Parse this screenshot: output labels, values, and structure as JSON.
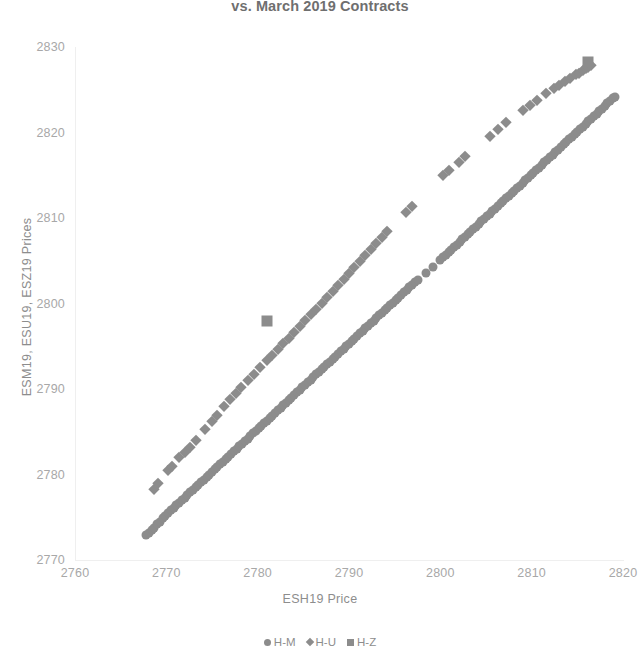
{
  "chart_data": {
    "type": "scatter",
    "title": "vs. March 2019 Contracts",
    "xlabel": "ESH19 Price",
    "ylabel": "ESM19, ESU19, ESZ19 Prices",
    "xlim": [
      2760,
      2820
    ],
    "ylim": [
      2770,
      2830
    ],
    "xticks": [
      2760,
      2770,
      2780,
      2790,
      2800,
      2810,
      2820
    ],
    "yticks": [
      2770,
      2780,
      2790,
      2800,
      2810,
      2820,
      2830
    ],
    "grid": false,
    "legend_position": "bottom",
    "marker_color": "#8c8c8c",
    "series": [
      {
        "name": "H-M",
        "marker": "circle",
        "points": [
          [
            2767.8,
            2772.9
          ],
          [
            2768.1,
            2773.2
          ],
          [
            2768.4,
            2773.5
          ],
          [
            2768.7,
            2773.8
          ],
          [
            2769.0,
            2774.2
          ],
          [
            2769.3,
            2774.5
          ],
          [
            2769.6,
            2774.9
          ],
          [
            2769.9,
            2775.2
          ],
          [
            2770.2,
            2775.5
          ],
          [
            2770.5,
            2775.8
          ],
          [
            2770.8,
            2776.1
          ],
          [
            2771.1,
            2776.4
          ],
          [
            2771.4,
            2776.7
          ],
          [
            2771.7,
            2777.0
          ],
          [
            2772.0,
            2777.3
          ],
          [
            2772.3,
            2777.6
          ],
          [
            2772.6,
            2777.9
          ],
          [
            2772.9,
            2778.2
          ],
          [
            2773.2,
            2778.5
          ],
          [
            2773.5,
            2778.8
          ],
          [
            2773.8,
            2779.1
          ],
          [
            2774.1,
            2779.4
          ],
          [
            2774.4,
            2779.7
          ],
          [
            2774.7,
            2780.0
          ],
          [
            2775.0,
            2780.3
          ],
          [
            2775.3,
            2780.6
          ],
          [
            2775.6,
            2780.9
          ],
          [
            2775.9,
            2781.2
          ],
          [
            2776.2,
            2781.5
          ],
          [
            2776.5,
            2781.8
          ],
          [
            2776.8,
            2782.1
          ],
          [
            2777.1,
            2782.4
          ],
          [
            2777.4,
            2782.7
          ],
          [
            2777.7,
            2783.0
          ],
          [
            2778.0,
            2783.3
          ],
          [
            2778.3,
            2783.6
          ],
          [
            2778.6,
            2783.9
          ],
          [
            2778.9,
            2784.2
          ],
          [
            2779.2,
            2784.5
          ],
          [
            2779.5,
            2784.8
          ],
          [
            2779.8,
            2785.1
          ],
          [
            2780.1,
            2785.4
          ],
          [
            2780.4,
            2785.7
          ],
          [
            2780.7,
            2786.0
          ],
          [
            2781.0,
            2786.3
          ],
          [
            2781.3,
            2786.6
          ],
          [
            2781.6,
            2786.9
          ],
          [
            2781.9,
            2787.2
          ],
          [
            2782.2,
            2787.5
          ],
          [
            2782.5,
            2787.8
          ],
          [
            2782.8,
            2788.1
          ],
          [
            2783.1,
            2788.4
          ],
          [
            2783.4,
            2788.7
          ],
          [
            2783.7,
            2789.0
          ],
          [
            2784.0,
            2789.3
          ],
          [
            2784.3,
            2789.6
          ],
          [
            2784.6,
            2789.9
          ],
          [
            2784.9,
            2790.2
          ],
          [
            2785.2,
            2790.5
          ],
          [
            2785.5,
            2790.8
          ],
          [
            2785.8,
            2791.1
          ],
          [
            2786.1,
            2791.4
          ],
          [
            2786.4,
            2791.7
          ],
          [
            2786.7,
            2792.0
          ],
          [
            2787.0,
            2792.3
          ],
          [
            2787.3,
            2792.6
          ],
          [
            2787.6,
            2792.9
          ],
          [
            2787.9,
            2793.2
          ],
          [
            2788.2,
            2793.5
          ],
          [
            2788.5,
            2793.8
          ],
          [
            2788.8,
            2794.1
          ],
          [
            2789.1,
            2794.4
          ],
          [
            2789.4,
            2794.7
          ],
          [
            2789.7,
            2795.0
          ],
          [
            2790.0,
            2795.3
          ],
          [
            2790.3,
            2795.6
          ],
          [
            2790.6,
            2795.9
          ],
          [
            2790.9,
            2796.2
          ],
          [
            2791.2,
            2796.5
          ],
          [
            2791.5,
            2796.8
          ],
          [
            2791.8,
            2797.1
          ],
          [
            2792.1,
            2797.4
          ],
          [
            2792.4,
            2797.7
          ],
          [
            2792.7,
            2798.0
          ],
          [
            2793.0,
            2798.3
          ],
          [
            2793.3,
            2798.6
          ],
          [
            2793.6,
            2798.9
          ],
          [
            2793.9,
            2799.2
          ],
          [
            2794.2,
            2799.5
          ],
          [
            2794.5,
            2799.8
          ],
          [
            2794.8,
            2800.1
          ],
          [
            2795.1,
            2800.4
          ],
          [
            2795.4,
            2800.7
          ],
          [
            2795.7,
            2801.0
          ],
          [
            2796.0,
            2801.3
          ],
          [
            2796.3,
            2801.6
          ],
          [
            2796.6,
            2801.9
          ],
          [
            2796.9,
            2802.2
          ],
          [
            2797.2,
            2802.5
          ],
          [
            2797.5,
            2802.8
          ],
          [
            2798.4,
            2803.6
          ],
          [
            2799.2,
            2804.3
          ],
          [
            2800.0,
            2805.1
          ],
          [
            2800.3,
            2805.4
          ],
          [
            2800.6,
            2805.7
          ],
          [
            2800.9,
            2806.0
          ],
          [
            2801.2,
            2806.3
          ],
          [
            2801.5,
            2806.6
          ],
          [
            2801.8,
            2806.9
          ],
          [
            2802.1,
            2807.2
          ],
          [
            2802.4,
            2807.5
          ],
          [
            2802.7,
            2807.8
          ],
          [
            2803.0,
            2808.1
          ],
          [
            2803.3,
            2808.4
          ],
          [
            2803.6,
            2808.7
          ],
          [
            2803.9,
            2809.0
          ],
          [
            2804.2,
            2809.3
          ],
          [
            2804.5,
            2809.6
          ],
          [
            2804.8,
            2809.9
          ],
          [
            2805.1,
            2810.2
          ],
          [
            2805.4,
            2810.5
          ],
          [
            2805.7,
            2810.8
          ],
          [
            2806.0,
            2811.1
          ],
          [
            2806.3,
            2811.4
          ],
          [
            2806.6,
            2811.7
          ],
          [
            2806.9,
            2812.0
          ],
          [
            2807.2,
            2812.3
          ],
          [
            2807.5,
            2812.6
          ],
          [
            2807.8,
            2812.9
          ],
          [
            2808.1,
            2813.2
          ],
          [
            2808.4,
            2813.5
          ],
          [
            2808.7,
            2813.8
          ],
          [
            2809.0,
            2814.1
          ],
          [
            2809.3,
            2814.4
          ],
          [
            2809.6,
            2814.7
          ],
          [
            2809.9,
            2815.0
          ],
          [
            2810.2,
            2815.3
          ],
          [
            2810.5,
            2815.6
          ],
          [
            2810.8,
            2815.9
          ],
          [
            2811.1,
            2816.2
          ],
          [
            2811.4,
            2816.5
          ],
          [
            2811.7,
            2816.8
          ],
          [
            2812.0,
            2817.1
          ],
          [
            2812.3,
            2817.4
          ],
          [
            2812.6,
            2817.7
          ],
          [
            2812.9,
            2818.0
          ],
          [
            2813.2,
            2818.3
          ],
          [
            2813.5,
            2818.6
          ],
          [
            2813.8,
            2818.9
          ],
          [
            2814.1,
            2819.2
          ],
          [
            2814.4,
            2819.5
          ],
          [
            2814.7,
            2819.8
          ],
          [
            2815.0,
            2820.1
          ],
          [
            2815.3,
            2820.4
          ],
          [
            2815.6,
            2820.7
          ],
          [
            2815.9,
            2821.0
          ],
          [
            2816.2,
            2821.3
          ],
          [
            2816.5,
            2821.6
          ],
          [
            2816.8,
            2821.9
          ],
          [
            2817.1,
            2822.2
          ],
          [
            2817.4,
            2822.5
          ],
          [
            2817.7,
            2822.8
          ],
          [
            2818.0,
            2823.1
          ],
          [
            2818.3,
            2823.4
          ],
          [
            2818.6,
            2823.7
          ],
          [
            2818.9,
            2824.0
          ],
          [
            2819.1,
            2824.2
          ]
        ]
      },
      {
        "name": "H-U",
        "marker": "diamond",
        "points": [
          [
            2768.6,
            2778.3
          ],
          [
            2769.1,
            2779.0
          ],
          [
            2770.2,
            2780.5
          ],
          [
            2770.6,
            2781.0
          ],
          [
            2771.4,
            2782.1
          ],
          [
            2772.0,
            2782.6
          ],
          [
            2772.6,
            2783.2
          ],
          [
            2773.2,
            2784.0
          ],
          [
            2774.2,
            2785.3
          ],
          [
            2775.0,
            2786.3
          ],
          [
            2775.6,
            2787.0
          ],
          [
            2776.3,
            2788.0
          ],
          [
            2777.0,
            2788.8
          ],
          [
            2777.6,
            2789.5
          ],
          [
            2778.2,
            2790.2
          ],
          [
            2778.9,
            2791.0
          ],
          [
            2779.6,
            2791.8
          ],
          [
            2780.3,
            2792.6
          ],
          [
            2781.0,
            2793.4
          ],
          [
            2781.6,
            2794.0
          ],
          [
            2782.2,
            2794.7
          ],
          [
            2782.8,
            2795.4
          ],
          [
            2783.4,
            2796.0
          ],
          [
            2784.0,
            2796.7
          ],
          [
            2784.6,
            2797.4
          ],
          [
            2785.2,
            2798.1
          ],
          [
            2785.8,
            2798.8
          ],
          [
            2786.4,
            2799.4
          ],
          [
            2787.0,
            2800.1
          ],
          [
            2787.6,
            2800.8
          ],
          [
            2788.2,
            2801.5
          ],
          [
            2788.8,
            2802.2
          ],
          [
            2789.4,
            2802.9
          ],
          [
            2790.0,
            2803.6
          ],
          [
            2790.6,
            2804.3
          ],
          [
            2791.2,
            2805.0
          ],
          [
            2791.8,
            2805.7
          ],
          [
            2792.4,
            2806.4
          ],
          [
            2793.0,
            2807.1
          ],
          [
            2793.6,
            2807.8
          ],
          [
            2794.2,
            2808.5
          ],
          [
            2796.2,
            2810.7
          ],
          [
            2796.9,
            2811.4
          ],
          [
            2800.3,
            2815.0
          ],
          [
            2801.0,
            2815.6
          ],
          [
            2802.0,
            2816.6
          ],
          [
            2802.7,
            2817.2
          ],
          [
            2805.4,
            2819.6
          ],
          [
            2806.3,
            2820.4
          ],
          [
            2807.2,
            2821.2
          ],
          [
            2809.0,
            2822.6
          ],
          [
            2809.8,
            2823.2
          ],
          [
            2810.6,
            2823.8
          ],
          [
            2811.6,
            2824.6
          ],
          [
            2812.4,
            2825.2
          ],
          [
            2813.0,
            2825.6
          ],
          [
            2813.6,
            2826.0
          ],
          [
            2814.2,
            2826.4
          ],
          [
            2814.8,
            2826.8
          ],
          [
            2815.2,
            2827.0
          ],
          [
            2815.6,
            2827.3
          ],
          [
            2815.9,
            2827.5
          ],
          [
            2816.2,
            2827.7
          ],
          [
            2816.5,
            2827.9
          ]
        ]
      },
      {
        "name": "H-Z",
        "marker": "square",
        "points": [
          [
            2781.0,
            2798.0
          ],
          [
            2816.2,
            2828.3
          ]
        ]
      }
    ]
  },
  "legend": {
    "items": [
      {
        "label": "H-M",
        "marker": "circle-marker-icon"
      },
      {
        "label": "H-U",
        "marker": "diamond-marker-icon"
      },
      {
        "label": "H-Z",
        "marker": "square-marker-icon"
      }
    ]
  }
}
